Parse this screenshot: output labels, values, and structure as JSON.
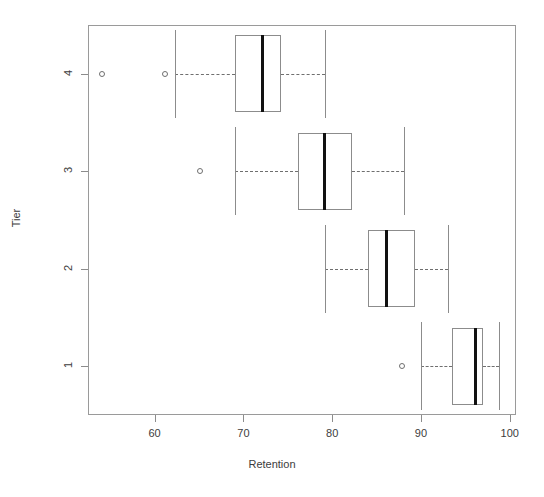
{
  "chart_data": {
    "type": "box",
    "title": "",
    "xlabel": "Retention",
    "ylabel": "Tier",
    "orientation": "horizontal",
    "xlim": [
      52.5,
      100.7
    ],
    "xticks": [
      60,
      70,
      80,
      90,
      100
    ],
    "xtick_labels": [
      "60",
      "70",
      "80",
      "90",
      "100"
    ],
    "yticks": [
      1,
      2,
      3,
      4
    ],
    "ytick_labels": [
      "1",
      "2",
      "3",
      "4"
    ],
    "y_order_top_to_bottom": [
      "4",
      "3",
      "2",
      "1"
    ],
    "grid": false,
    "legend": null,
    "boxes": [
      {
        "category": "4",
        "whisker_low": 62.3,
        "q1": 69.0,
        "median": 72.2,
        "q3": 74.2,
        "whisker_high": 79.2,
        "outliers": [
          54.1,
          61.2
        ]
      },
      {
        "category": "3",
        "whisker_low": 69.1,
        "q1": 76.1,
        "median": 79.1,
        "q3": 82.2,
        "whisker_high": 88.1,
        "outliers": [
          65.1
        ]
      },
      {
        "category": "2",
        "whisker_low": 79.2,
        "q1": 84.0,
        "median": 86.1,
        "q3": 89.3,
        "whisker_high": 93.0,
        "outliers": []
      },
      {
        "category": "1",
        "whisker_low": 90.0,
        "q1": 93.5,
        "median": 96.1,
        "q3": 97.0,
        "whisker_high": 98.8,
        "outliers": [
          87.9
        ]
      }
    ]
  }
}
